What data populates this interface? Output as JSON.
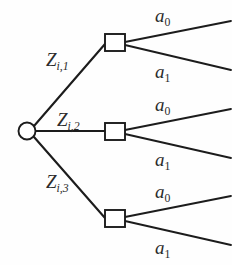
{
  "figure": {
    "type": "decision-tree-diagram",
    "colors": {
      "line": "#1c1c1c",
      "text": "#2b2b2b",
      "background": "#ffffff",
      "node_fill": "#ffffff"
    }
  },
  "nodes": {
    "root": {
      "shape": "circle",
      "cx": 27,
      "cy": 131,
      "r": 8.5,
      "name": "root-chance-node"
    },
    "decision": [
      {
        "shape": "square",
        "x": 105,
        "y": 34,
        "w": 20,
        "h": 17,
        "name": "decision-node-1"
      },
      {
        "shape": "square",
        "x": 105,
        "y": 123,
        "w": 20,
        "h": 17,
        "name": "decision-node-2"
      },
      {
        "shape": "square",
        "x": 105,
        "y": 210,
        "w": 20,
        "h": 17,
        "name": "decision-node-3"
      }
    ]
  },
  "edges": {
    "from_root": [
      {
        "label_html": "Z<span class=\"sub\">i,1</span>",
        "label_x": 46,
        "label_y": 50,
        "x1": 34,
        "y1": 126,
        "x2": 105,
        "y2": 44
      },
      {
        "label_html": "Z<span class=\"sub\">i,2</span>",
        "label_x": 57,
        "label_y": 110,
        "x1": 36,
        "y1": 131,
        "x2": 105,
        "y2": 131
      },
      {
        "label_html": "Z<span class=\"sub\">i,3</span>",
        "label_x": 46,
        "label_y": 172,
        "x1": 34,
        "y1": 137,
        "x2": 105,
        "y2": 218
      }
    ],
    "branches": [
      {
        "label_html": "a<span class=\"sub sub-upright\">0</span>",
        "label_x": 155,
        "label_y": 6,
        "x1": 125,
        "y1": 42,
        "x2": 231,
        "y2": 21
      },
      {
        "label_html": "a<span class=\"sub sub-upright\">1</span>",
        "label_x": 155,
        "label_y": 62,
        "x1": 125,
        "y1": 45,
        "x2": 231,
        "y2": 70
      },
      {
        "label_html": "a<span class=\"sub sub-upright\">0</span>",
        "label_x": 155,
        "label_y": 95,
        "x1": 125,
        "y1": 130,
        "x2": 231,
        "y2": 109
      },
      {
        "label_html": "a<span class=\"sub sub-upright\">1</span>",
        "label_x": 155,
        "label_y": 150,
        "x1": 125,
        "y1": 134,
        "x2": 231,
        "y2": 158
      },
      {
        "label_html": "a<span class=\"sub sub-upright\">0</span>",
        "label_x": 155,
        "label_y": 182,
        "x1": 125,
        "y1": 217,
        "x2": 231,
        "y2": 196
      },
      {
        "label_html": "a<span class=\"sub sub-upright\">1</span>",
        "label_x": 155,
        "label_y": 238,
        "x1": 125,
        "y1": 221,
        "x2": 231,
        "y2": 245
      }
    ]
  },
  "labels": {
    "z1": "Z_{i,1}",
    "z2": "Z_{i,2}",
    "z3": "Z_{i,3}",
    "a0": "a_0",
    "a1": "a_1"
  }
}
